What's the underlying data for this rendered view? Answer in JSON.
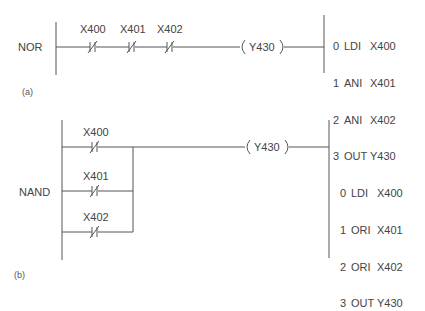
{
  "diagram_a": {
    "caption": "(a)",
    "gate_label": "NOR",
    "contacts": [
      {
        "address": "X400",
        "type": "normally-closed"
      },
      {
        "address": "X401",
        "type": "normally-closed"
      },
      {
        "address": "X402",
        "type": "normally-closed"
      }
    ],
    "coil": {
      "address": "Y430",
      "display": "Y430"
    },
    "program": [
      {
        "step": "0",
        "op": "LDI",
        "operand": "X400"
      },
      {
        "step": "1",
        "op": "ANI",
        "operand": "X401"
      },
      {
        "step": "2",
        "op": "ANI",
        "operand": "X402"
      },
      {
        "step": "3",
        "op": "OUT",
        "operand": "Y430"
      }
    ]
  },
  "diagram_b": {
    "caption": "(b)",
    "gate_label": "NAND",
    "contacts": [
      {
        "address": "X400",
        "type": "normally-closed"
      },
      {
        "address": "X401",
        "type": "normally-closed"
      },
      {
        "address": "X402",
        "type": "normally-closed"
      }
    ],
    "coil": {
      "address": "Y430",
      "display": "Y430"
    },
    "program": [
      {
        "step": "0",
        "op": "LDI",
        "operand": "X400"
      },
      {
        "step": "1",
        "op": "ORI",
        "operand": "X401"
      },
      {
        "step": "2",
        "op": "ORI",
        "operand": "X402"
      },
      {
        "step": "3",
        "op": "OUT",
        "operand": "Y430"
      }
    ]
  },
  "colors": {
    "line": "#555555",
    "text": "#444444",
    "background": "#ffffff"
  }
}
